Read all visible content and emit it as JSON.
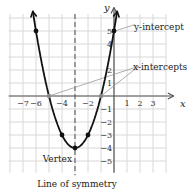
{
  "chart_data": {
    "type": "line",
    "function": "y = x^2 + 6x + 5",
    "x_range": [
      -8,
      4
    ],
    "y_range": [
      -6,
      6
    ],
    "grid": true,
    "x_ticks": [
      "-7",
      "-6",
      "-4",
      "-2",
      "1",
      "2",
      "3"
    ],
    "y_ticks": [
      "5",
      "4",
      "2",
      "1",
      "-1",
      "-2",
      "-3",
      "-4",
      "-5"
    ],
    "x_label": "x",
    "y_label": "y",
    "points": [
      [
        -6,
        5
      ],
      [
        -5,
        0
      ],
      [
        -4,
        -3
      ],
      [
        -3,
        -4
      ],
      [
        -2,
        -3
      ],
      [
        -1,
        0
      ],
      [
        0,
        5
      ]
    ],
    "vertex": [
      -3,
      -4
    ],
    "x_intercepts": [
      -5,
      -1
    ],
    "y_intercept": 5,
    "axis_of_symmetry": -3
  },
  "labels": {
    "y_intercept": "y-intercept",
    "x_intercepts": "x-intercepts",
    "vertex": "Vertex",
    "symmetry": "Line of symmetry",
    "x_axis": "x",
    "y_axis": "y"
  }
}
